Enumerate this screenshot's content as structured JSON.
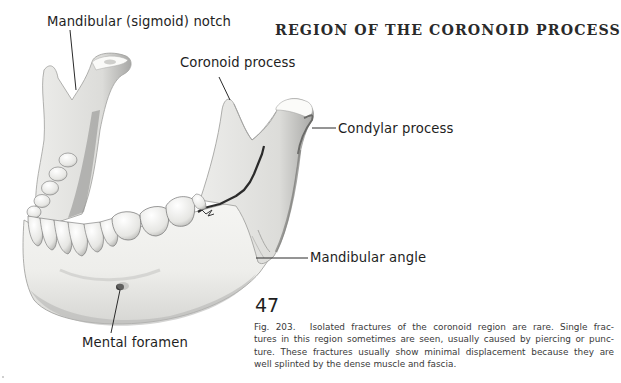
{
  "page": {
    "running_head": "REGION OF THE CORONOID PROCESS",
    "page_number": "47"
  },
  "figure": {
    "labels": {
      "mandibular_notch": "Mandibular (sigmoid) notch",
      "coronoid_process": "Coronoid process",
      "condylar_process": "Condylar process",
      "mandibular_angle": "Mandibular angle",
      "mental_foramen": "Mental foramen"
    },
    "caption": {
      "figure_number": "Fig. 203.",
      "lines": [
        "Isolated fractures of the coronoid region are rare. Single frac-",
        "tures in this region sometimes are seen, usually caused by piercing or punc-",
        "ture. These fractures usually show minimal displacement because they are",
        "well splinted by the dense muscle and fascia."
      ]
    }
  },
  "colors": {
    "bone_light": "#f4f4f2",
    "bone_mid": "#d9d9d6",
    "bone_shadow": "#9a9a98",
    "ink": "#1e1e1e",
    "fracture": "#2b2b2b"
  }
}
